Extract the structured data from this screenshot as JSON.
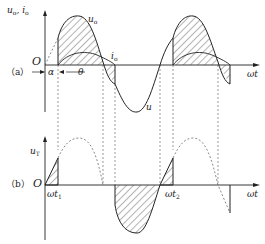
{
  "panel_a": {
    "label": "（a）",
    "yaxis_label": "u",
    "yaxis_label_sub": "o",
    "yaxis_label2": ", i",
    "yaxis_label2_sub": "o",
    "origin": "O",
    "alpha": "α",
    "theta": "θ",
    "curve_uo": "u",
    "curve_uo_sub": "o",
    "curve_io": "i",
    "curve_io_sub": "o",
    "curve_u": "u",
    "xaxis_label": "ωt"
  },
  "panel_b": {
    "label": "（b）",
    "yaxis_label": "u",
    "yaxis_label_sub": "T",
    "origin": "O",
    "t1": "ωt",
    "t1_sub": "1",
    "t2": "ωt",
    "t2_sub": "2",
    "xaxis_label": "ωt"
  },
  "colors": {
    "line": "#222222",
    "hatch": "#444444",
    "dash": "#555555"
  }
}
